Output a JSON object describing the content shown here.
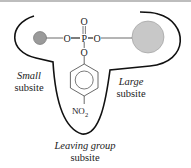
{
  "diagram": {
    "subsites": {
      "small": {
        "line1": "Small",
        "line2": "subsite"
      },
      "large": {
        "line1": "Large",
        "line2": "subsite"
      },
      "leaving": {
        "line1": "Leaving group",
        "line2": "subsite"
      }
    },
    "molecule": {
      "phosphorus": "P",
      "oxygen_top": "O",
      "oxygen_left": "O",
      "oxygen_right": "O",
      "oxygen_bottom": "O",
      "nitro_group_main": "NO",
      "nitro_group_sub": "2"
    },
    "colors": {
      "outline": "#111111",
      "small_group": "#9a9a9a",
      "large_group": "#c8c8c8",
      "bond": "#444444"
    }
  }
}
